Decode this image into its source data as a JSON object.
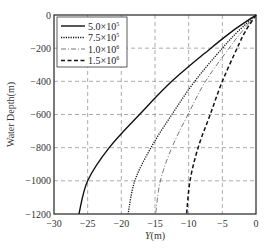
{
  "chart_data": {
    "type": "line",
    "title": "",
    "xlabel": "Y(m)",
    "ylabel": "Water Depth(m)",
    "xlim": [
      -30,
      0
    ],
    "ylim": [
      -1200,
      0
    ],
    "xticks": [
      -30,
      -25,
      -20,
      -15,
      -10,
      -5,
      0
    ],
    "yticks": [
      0,
      -200,
      -400,
      -600,
      -800,
      -1000,
      -1200
    ],
    "grid": true,
    "legend_position": "top-left",
    "series": [
      {
        "name": "5.0×10⁵",
        "label_base": "5.0×10",
        "label_exp": "5",
        "style": "solid",
        "color": "#111111",
        "points": [
          [
            0,
            0
          ],
          [
            -3.6,
            -100
          ],
          [
            -6.7,
            -200
          ],
          [
            -12.5,
            -400
          ],
          [
            -17.3,
            -600
          ],
          [
            -21.8,
            -800
          ],
          [
            -25.0,
            -1000
          ],
          [
            -26.3,
            -1200
          ]
        ]
      },
      {
        "name": "7.5×10⁵",
        "label_base": "7.5×10",
        "label_exp": "5",
        "style": "dotted",
        "color": "#111111",
        "points": [
          [
            0,
            0
          ],
          [
            -2.7,
            -100
          ],
          [
            -5.0,
            -200
          ],
          [
            -9.1,
            -400
          ],
          [
            -12.5,
            -600
          ],
          [
            -15.6,
            -800
          ],
          [
            -18.0,
            -1000
          ],
          [
            -19.0,
            -1200
          ]
        ]
      },
      {
        "name": "1.0×10⁶",
        "label_base": "1.0×10",
        "label_exp": "6",
        "style": "dashdot",
        "color": "#555555",
        "points": [
          [
            0,
            0
          ],
          [
            -2.1,
            -100
          ],
          [
            -4.0,
            -200
          ],
          [
            -7.5,
            -400
          ],
          [
            -10.1,
            -600
          ],
          [
            -12.5,
            -800
          ],
          [
            -14.2,
            -1000
          ],
          [
            -14.9,
            -1200
          ]
        ]
      },
      {
        "name": "1.5×10⁶",
        "label_base": "1.5×10",
        "label_exp": "6",
        "style": "dashed",
        "color": "#111111",
        "points": [
          [
            0,
            0
          ],
          [
            -1.6,
            -100
          ],
          [
            -2.8,
            -200
          ],
          [
            -5.0,
            -400
          ],
          [
            -6.8,
            -600
          ],
          [
            -8.6,
            -800
          ],
          [
            -9.8,
            -1000
          ],
          [
            -10.3,
            -1200
          ]
        ]
      }
    ]
  }
}
